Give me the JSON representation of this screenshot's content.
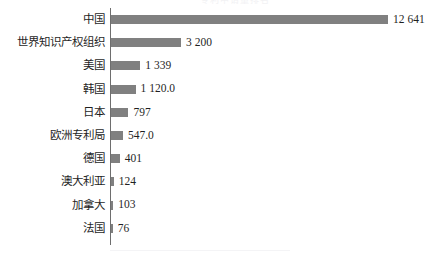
{
  "figure": {
    "title_remnant": "专利申请量排名",
    "background_color": "#ffffff",
    "bar_color": "#808080",
    "axis_color": "#6e6e6e",
    "text_color": "#1f1f1f"
  },
  "chart_data": {
    "type": "bar",
    "orientation": "horizontal",
    "title": "",
    "xlabel": "",
    "ylabel": "",
    "grid": false,
    "legend": null,
    "xlim": [
      0,
      12641
    ],
    "categories": [
      "中国",
      "世界知识产权组织",
      "美国",
      "韩国",
      "日本",
      "欧洲专利局",
      "德国",
      "澳大利亚",
      "加拿大",
      "法国"
    ],
    "values": [
      12641,
      3200,
      1339,
      1120.0,
      797,
      547.0,
      401,
      124,
      103,
      76
    ],
    "value_labels": [
      "12 641",
      "3 200",
      "1 339",
      "1 120.0",
      "797",
      "547.0",
      "401",
      "124",
      "103",
      "76"
    ]
  }
}
